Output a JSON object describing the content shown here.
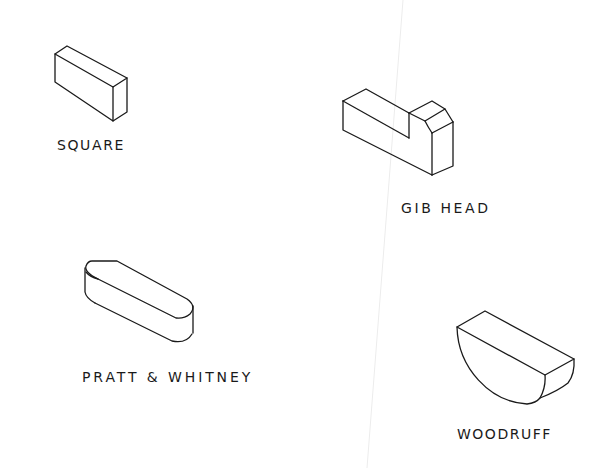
{
  "figure": {
    "keys": [
      {
        "id": "square",
        "label": "SQUARE"
      },
      {
        "id": "gib_head",
        "label": "GIB HEAD"
      },
      {
        "id": "pratt_whitney",
        "label": "PRATT & WHITNEY"
      },
      {
        "id": "woodruff",
        "label": "WOODRUFF"
      }
    ],
    "colors": {
      "line": "#1a1a1a",
      "background": "#ffffff",
      "artifact_line": "#ececec"
    }
  }
}
